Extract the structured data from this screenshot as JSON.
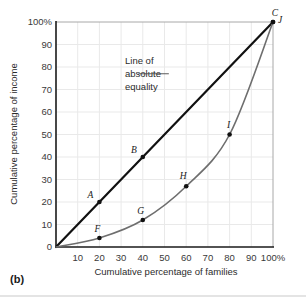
{
  "figure": {
    "panel_label": "(b)",
    "background_color": "#ffffff",
    "footer_rule_color": "#c9c9c9"
  },
  "chart_data": {
    "type": "line",
    "title": "",
    "xlabel": "Cumulative percentage of families",
    "ylabel": "Cumulative percentage of income",
    "xlim": [
      0,
      100
    ],
    "ylim": [
      0,
      100
    ],
    "grid": true,
    "grid_color": "#e9e9e9",
    "xticks": [
      0,
      10,
      20,
      30,
      40,
      50,
      60,
      70,
      80,
      90,
      100
    ],
    "xtick_labels": [
      "",
      "10",
      "20",
      "30",
      "40",
      "50",
      "60",
      "70",
      "80",
      "90",
      "100%"
    ],
    "yticks": [
      0,
      10,
      20,
      30,
      40,
      50,
      60,
      70,
      80,
      90,
      100
    ],
    "ytick_labels": [
      "0",
      "10",
      "20",
      "30",
      "40",
      "50",
      "60",
      "70",
      "80",
      "90",
      "100%"
    ],
    "legend_position": "none",
    "series": [
      {
        "name": "Line of absolute equality",
        "color": "#111111",
        "width": 2.2,
        "x": [
          0,
          20,
          40,
          100
        ],
        "values": [
          0,
          20,
          40,
          100
        ],
        "markers": [
          {
            "label": "A",
            "x": 20,
            "y": 20
          },
          {
            "label": "B",
            "x": 40,
            "y": 40
          },
          {
            "label": "C",
            "x": 100,
            "y": 100
          }
        ]
      },
      {
        "name": "Lorenz curve",
        "color": "#6e6e6e",
        "width": 1.6,
        "x": [
          0,
          20,
          40,
          60,
          80,
          100
        ],
        "values": [
          0,
          4,
          12,
          27,
          50,
          100
        ],
        "markers": [
          {
            "label": "F",
            "x": 20,
            "y": 4
          },
          {
            "label": "G",
            "x": 40,
            "y": 12
          },
          {
            "label": "H",
            "x": 60,
            "y": 27
          },
          {
            "label": "I",
            "x": 80,
            "y": 50
          },
          {
            "label": "J",
            "x": 100,
            "y": 100
          }
        ]
      }
    ],
    "annotations": [
      {
        "name": "line-of-absolute-equality",
        "lines": [
          "Line of",
          "absolute",
          "equality"
        ],
        "leader_from": [
          38,
          77
        ],
        "leader_to": [
          52,
          77
        ]
      }
    ]
  }
}
